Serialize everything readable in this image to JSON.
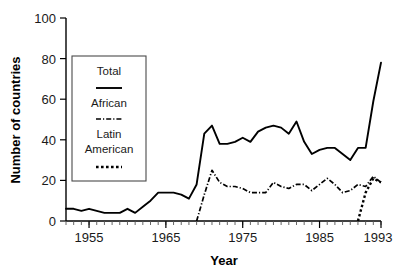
{
  "chart_data": {
    "type": "line",
    "title": "",
    "xlabel": "Year",
    "ylabel": "Number of countries",
    "xlim": [
      1952,
      1993
    ],
    "ylim": [
      0,
      100
    ],
    "grid": false,
    "legend_position": "upper-left-inset",
    "x_tick_labels": [
      "1955",
      "1965",
      "1975",
      "1985",
      "1993"
    ],
    "x_tick_values": [
      1955,
      1965,
      1975,
      1985,
      1993
    ],
    "y_tick_labels": [
      "0",
      "20",
      "40",
      "60",
      "80",
      "100"
    ],
    "y_tick_values": [
      0,
      20,
      40,
      60,
      80,
      100
    ],
    "x": [
      1952,
      1953,
      1954,
      1955,
      1956,
      1957,
      1958,
      1959,
      1960,
      1961,
      1962,
      1963,
      1964,
      1965,
      1966,
      1967,
      1968,
      1969,
      1970,
      1971,
      1972,
      1973,
      1974,
      1975,
      1976,
      1977,
      1978,
      1979,
      1980,
      1981,
      1982,
      1983,
      1984,
      1985,
      1986,
      1987,
      1988,
      1989,
      1990,
      1991,
      1992,
      1993
    ],
    "series": [
      {
        "name": "Total",
        "style": "solid",
        "values": [
          6,
          6,
          5,
          6,
          5,
          4,
          4,
          4,
          6,
          4,
          7,
          10,
          14,
          14,
          14,
          13,
          11,
          18,
          43,
          47,
          38,
          38,
          39,
          41,
          39,
          44,
          46,
          47,
          46,
          43,
          49,
          39,
          33,
          35,
          36,
          36,
          33,
          30,
          36,
          36,
          59,
          78
        ]
      },
      {
        "name": "African",
        "style": "dash-dot",
        "values": [
          null,
          null,
          null,
          null,
          null,
          null,
          null,
          null,
          null,
          null,
          null,
          null,
          null,
          null,
          null,
          null,
          null,
          0,
          13,
          25,
          19,
          17,
          17,
          16,
          14,
          14,
          14,
          19,
          17,
          16,
          18,
          18,
          15,
          18,
          21,
          18,
          14,
          15,
          18,
          17,
          22,
          19
        ]
      },
      {
        "name": "Latin American",
        "style": "dotted",
        "values": [
          null,
          null,
          null,
          null,
          null,
          null,
          null,
          null,
          null,
          null,
          null,
          null,
          null,
          null,
          null,
          null,
          null,
          null,
          null,
          null,
          null,
          null,
          null,
          null,
          null,
          null,
          null,
          null,
          null,
          null,
          null,
          null,
          null,
          null,
          null,
          null,
          null,
          null,
          0,
          14,
          21,
          19
        ]
      }
    ]
  },
  "legend": {
    "entries": [
      {
        "label": "Total",
        "style": "solid"
      },
      {
        "label": "African",
        "style": "dash-dot"
      },
      {
        "label": "Latin",
        "label2": "American",
        "style": "dotted"
      }
    ],
    "total_label": "Total",
    "african_label": "African",
    "latin_label_line1": "Latin",
    "latin_label_line2": "American"
  },
  "axes": {
    "x_title": "Year",
    "y_title": "Number of countries",
    "y_0": "0",
    "y_20": "20",
    "y_40": "40",
    "y_60": "60",
    "y_80": "80",
    "y_100": "100",
    "x_1955": "1955",
    "x_1965": "1965",
    "x_1975": "1975",
    "x_1985": "1985",
    "x_1993": "1993"
  },
  "colors": {
    "ink": "#000000",
    "background": "#ffffff",
    "legend_border": "#4a4a4a"
  }
}
